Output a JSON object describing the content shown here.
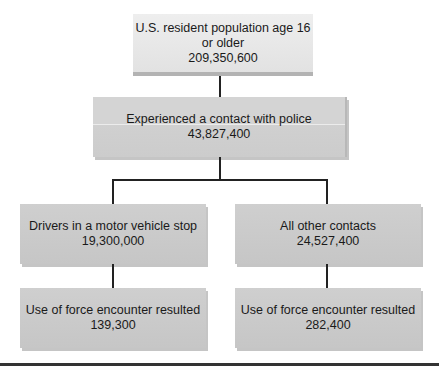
{
  "diagram": {
    "type": "flowchart",
    "nodes": [
      {
        "id": "population",
        "label": "U.S. resident population age 16 or older",
        "value": "209,350,600"
      },
      {
        "id": "contact",
        "label": "Experienced a contact with police",
        "value": "43,827,400"
      },
      {
        "id": "drivers",
        "label": "Drivers in a motor vehicle stop",
        "value": "19,300,000"
      },
      {
        "id": "other",
        "label": "All other contacts",
        "value": "24,527,400"
      },
      {
        "id": "force_drivers",
        "label": "Use of force encounter resulted",
        "value": "139,300"
      },
      {
        "id": "force_other",
        "label": "Use of force encounter resulted",
        "value": "282,400"
      }
    ],
    "edges": [
      [
        "population",
        "contact"
      ],
      [
        "contact",
        "drivers"
      ],
      [
        "contact",
        "other"
      ],
      [
        "drivers",
        "force_drivers"
      ],
      [
        "other",
        "force_other"
      ]
    ]
  },
  "colors": {
    "top_box": "#e6e6e6",
    "mid_box": "#d0d0d0",
    "lower_box": "#c8c8c8",
    "connector": "#222222"
  }
}
